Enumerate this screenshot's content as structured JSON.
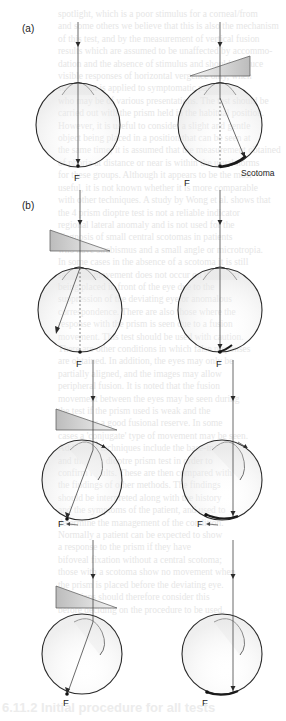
{
  "background_text": {
    "lines": [
      "spotlight, which is a poor stimulus for a corneal/from",
      "and some others we believe that this is also the mechanism",
      "of this test, and by the measurement of vertical fusion",
      "results which are assumed to be unaffected by accommo-",
      "dation and the absence of stimulus and should produce",
      "visible responses of horizontal vergence only, when",
      "such a test is applied to symptomatic patients",
      "who may be of various presentations. The test should be",
      "carried out with the prism held in the habitual position.",
      "However, it is useful to consider a slight and gentle",
      "object being placed in a position that can be seen at",
      "the same time; it is assumed that the measurement obtained",
      "of phoria at distance or near is within the usual norms",
      "for these groups. Although it appears to be the most",
      "useful, it is not known whether it is more comparable",
      "with other techniques. A study by Wong et al. shows that",
      "the 4 prism dioptre test is not a reliable indicator",
      "regional lateral anomaly and is not used for the",
      "diagnosis of small central scotomas in patients",
      "who have strabismus and a small angle or microtropia.",
      "In some cases in the absence of a scotoma it is still",
      "seen that movement does not occur on the prism",
      "being placed in front of the eye due to the",
      "suppression of the deviating eye or anomalous",
      "correspondence. There are also those where the",
      "response with the prism is seen due to a fusion",
      "movement. This test should be used with caution.",
      "There are other conditions in which false responses",
      "are obtained. In addition, the eyes may only be",
      "partially aligned, and the images may allow",
      "peripheral fusion. It is noted that the fusion",
      "movement between the eyes may be seen during",
      "the test if the prism used is weak and the",
      "patient has a good fusional reserve. In some",
      "cases a 'conjugate' type of movement may be seen.",
      "Additional techniques include the base-in test",
      "and the four dioptre prism test in order to",
      "confirm results. These are then compared with",
      "the findings of other methods. The findings",
      "should be interpreted along with the history",
      "and the symptoms of the patient, and used to",
      "determine the management of the condition.",
      "Normally a patient can be expected to show",
      "a response to the prism if they have",
      "bifoveal fixation without a central scotoma;",
      "those with a scotoma show no movement when",
      "the prism is placed before the deviating eye.",
      "Clinicians should therefore consider this",
      "before deciding on the procedure to be used."
    ]
  },
  "figure": {
    "panel_a": {
      "label": "(a)",
      "left_eye": {
        "fovea_label": "F"
      },
      "right_eye": {
        "fovea_label": "F",
        "scotoma_label": "Scotoma"
      }
    },
    "panel_b": {
      "label": "(b)",
      "rows": [
        {
          "left_fovea_label": "F",
          "right_fovea_label": "F"
        },
        {
          "left_fovea_label": "F",
          "right_fovea_label": "F"
        },
        {
          "left_fovea_label": "F",
          "right_fovea_label": "F"
        }
      ]
    },
    "colors": {
      "line": "#2a2a2a",
      "prism_dark": "#bdbdbd",
      "prism_light": "#f3f3f3",
      "eye_shade": "#ececec",
      "scotoma": "#1a1a1a"
    }
  },
  "section_heading": "6.11.2 Initial procedure for all tests"
}
